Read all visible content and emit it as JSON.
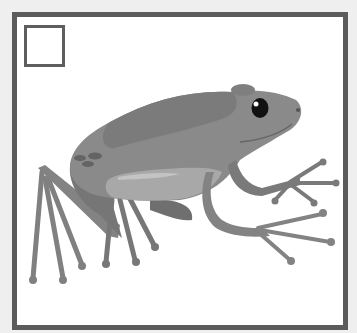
{
  "image": {
    "subject": "frog-illustration",
    "caption": "",
    "colors": {
      "background": "#efefef",
      "frame": "#5b5b5b",
      "body": "#8a8a8a",
      "body_dark": "#7a7a7a",
      "belly": "#a9a9a9",
      "belly_highlight": "#c4c4c4",
      "limb": "#7e7e7e",
      "eye": "#111111"
    }
  },
  "checkbox": {
    "checked": false
  }
}
